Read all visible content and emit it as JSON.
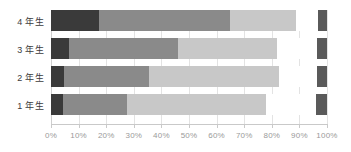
{
  "chart_data": {
    "type": "bar",
    "orientation": "horizontal",
    "stacked": true,
    "normalized": true,
    "title": "",
    "xlabel": "",
    "ylabel": "",
    "xlim": [
      0,
      100
    ],
    "grid": true,
    "legend": "none",
    "categories": [
      "4 年生",
      "3 年生",
      "2 年生",
      "1 年生"
    ],
    "category_order_top_to_bottom": [
      "4 年生",
      "3 年生",
      "2 年生",
      "1 年生"
    ],
    "xticks": [
      0,
      10,
      20,
      30,
      40,
      50,
      60,
      70,
      80,
      90,
      100
    ],
    "xticklabels": [
      "0%",
      "10%",
      "20%",
      "30%",
      "40%",
      "50%",
      "60%",
      "70%",
      "80%",
      "90%",
      "100%"
    ],
    "colors": {
      "segment1": "#3a3a3a",
      "segment2": "#8a8a8a",
      "segment3": "#c8c8c8",
      "segment4": "#ffffff",
      "segment5": "#5a5a5a",
      "gridline": "#e3e3e3",
      "axis": "#c9c9c9",
      "category_text": "#3c3c3c",
      "tick_text": "#9a9a9a"
    },
    "series": [
      {
        "name": "segment1",
        "color": "#3a3a3a",
        "values": [
          17.4,
          6.5,
          4.7,
          4.3
        ]
      },
      {
        "name": "segment2",
        "color": "#8a8a8a",
        "values": [
          47.6,
          39.5,
          30.8,
          23.2
        ]
      },
      {
        "name": "segment3",
        "color": "#c8c8c8",
        "values": [
          23.8,
          36.0,
          47.0,
          50.5
        ]
      },
      {
        "name": "segment4",
        "color": "#ffffff",
        "values": [
          7.9,
          14.5,
          14.0,
          18.0
        ]
      },
      {
        "name": "segment5",
        "color": "#5a5a5a",
        "values": [
          3.3,
          3.5,
          3.5,
          4.0
        ]
      }
    ],
    "rows": [
      {
        "category": "4 年生",
        "segments": [
          {
            "name": "segment1",
            "value": 17.4,
            "start": 0.0,
            "end": 17.4,
            "color": "#3a3a3a"
          },
          {
            "name": "segment2",
            "value": 47.6,
            "start": 17.4,
            "end": 65.0,
            "color": "#8a8a8a"
          },
          {
            "name": "segment3",
            "value": 23.8,
            "start": 65.0,
            "end": 88.8,
            "color": "#c8c8c8"
          },
          {
            "name": "segment4",
            "value": 7.9,
            "start": 88.8,
            "end": 96.7,
            "color": "#ffffff"
          },
          {
            "name": "segment5",
            "value": 3.3,
            "start": 96.7,
            "end": 100.0,
            "color": "#5a5a5a"
          }
        ]
      },
      {
        "category": "3 年生",
        "segments": [
          {
            "name": "segment1",
            "value": 6.5,
            "start": 0.0,
            "end": 6.5,
            "color": "#3a3a3a"
          },
          {
            "name": "segment2",
            "value": 39.5,
            "start": 6.5,
            "end": 46.0,
            "color": "#8a8a8a"
          },
          {
            "name": "segment3",
            "value": 36.0,
            "start": 46.0,
            "end": 82.0,
            "color": "#c8c8c8"
          },
          {
            "name": "segment4",
            "value": 14.5,
            "start": 82.0,
            "end": 96.5,
            "color": "#ffffff"
          },
          {
            "name": "segment5",
            "value": 3.5,
            "start": 96.5,
            "end": 100.0,
            "color": "#5a5a5a"
          }
        ]
      },
      {
        "category": "2 年生",
        "segments": [
          {
            "name": "segment1",
            "value": 4.7,
            "start": 0.0,
            "end": 4.7,
            "color": "#3a3a3a"
          },
          {
            "name": "segment2",
            "value": 30.8,
            "start": 4.7,
            "end": 35.5,
            "color": "#8a8a8a"
          },
          {
            "name": "segment3",
            "value": 47.0,
            "start": 35.5,
            "end": 82.5,
            "color": "#c8c8c8"
          },
          {
            "name": "segment4",
            "value": 14.0,
            "start": 82.5,
            "end": 96.5,
            "color": "#ffffff"
          },
          {
            "name": "segment5",
            "value": 3.5,
            "start": 96.5,
            "end": 100.0,
            "color": "#5a5a5a"
          }
        ]
      },
      {
        "category": "1 年生",
        "segments": [
          {
            "name": "segment1",
            "value": 4.3,
            "start": 0.0,
            "end": 4.3,
            "color": "#3a3a3a"
          },
          {
            "name": "segment2",
            "value": 23.2,
            "start": 4.3,
            "end": 27.5,
            "color": "#8a8a8a"
          },
          {
            "name": "segment3",
            "value": 50.5,
            "start": 27.5,
            "end": 78.0,
            "color": "#c8c8c8"
          },
          {
            "name": "segment4",
            "value": 18.0,
            "start": 78.0,
            "end": 96.0,
            "color": "#ffffff"
          },
          {
            "name": "segment5",
            "value": 4.0,
            "start": 96.0,
            "end": 100.0,
            "color": "#5a5a5a"
          }
        ]
      }
    ]
  }
}
